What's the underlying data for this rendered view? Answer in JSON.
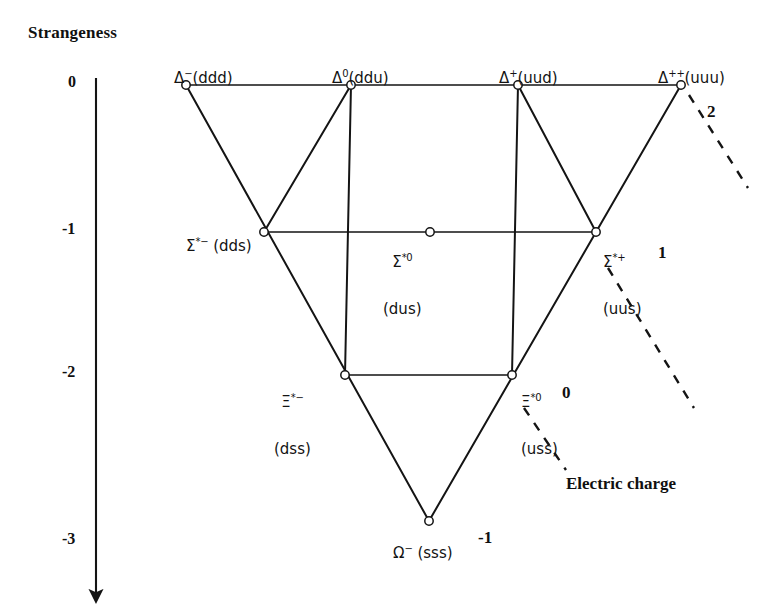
{
  "figure": {
    "kind": "baryon-decuplet-weight-diagram",
    "axis_title": "Strangeness",
    "charge_axis_title": "Electric charge",
    "line_color": "#141414",
    "vertex_fill": "#ffffff",
    "background": "#ffffff"
  },
  "strangeness_axis": {
    "ticks": [
      {
        "label": "0",
        "y_px": 85
      },
      {
        "label": "-1",
        "y_px": 232
      },
      {
        "label": "-2",
        "y_px": 375
      },
      {
        "label": "-3",
        "y_px": 542
      }
    ],
    "arrow_from_y": 78,
    "arrow_to_y": 604,
    "x_px": 96
  },
  "charge_labels": [
    {
      "label": "2",
      "x_px": 707,
      "y_px": 103
    },
    {
      "label": "1",
      "x_px": 658,
      "y_px": 244
    },
    {
      "label": "0",
      "x_px": 562,
      "y_px": 384
    },
    {
      "label": "-1",
      "x_px": 478,
      "y_px": 529
    }
  ],
  "nodes": [
    {
      "id": "delta-minus",
      "symbol": "Δ",
      "superscript": "−",
      "quarks": "(ddd)",
      "strangeness": 0,
      "charge": -1,
      "x_px": 186,
      "y_px": 85,
      "label_html": "Δ⁻(ddd)",
      "label_x_px": 155,
      "label_y_px": 55,
      "label_align": "left"
    },
    {
      "id": "delta-zero",
      "symbol": "Δ",
      "superscript": "0",
      "quarks": "(ddu)",
      "strangeness": 0,
      "charge": 0,
      "x_px": 351,
      "y_px": 85,
      "label_html": "Δ⁰(ddu)",
      "label_x_px": 313,
      "label_y_px": 55,
      "label_align": "left"
    },
    {
      "id": "delta-plus",
      "symbol": "Δ",
      "superscript": "+",
      "quarks": "(uud)",
      "strangeness": 0,
      "charge": 1,
      "x_px": 518,
      "y_px": 85,
      "label_html": "Δ⁺(uud)",
      "label_x_px": 480,
      "label_y_px": 55,
      "label_align": "left"
    },
    {
      "id": "delta-plusplus",
      "symbol": "Δ",
      "superscript": "++",
      "quarks": "(uuu)",
      "strangeness": 0,
      "charge": 2,
      "x_px": 681,
      "y_px": 85,
      "label_html": "Δ⁺⁺(uuu)",
      "label_x_px": 641,
      "label_y_px": 55,
      "label_align": "left"
    },
    {
      "id": "sigma-star-minus",
      "symbol": "Σ",
      "superscript": "*−",
      "quarks": "(dds)",
      "strangeness": -1,
      "charge": -1,
      "x_px": 264,
      "y_px": 232,
      "label_html": "Σ*⁻ (dds)",
      "label_x_px": 167,
      "label_y_px": 222,
      "label_align": "left"
    },
    {
      "id": "sigma-star-zero",
      "symbol": "Σ",
      "superscript": "*0",
      "quarks": "(dus)",
      "strangeness": -1,
      "charge": 0,
      "x_px": 430,
      "y_px": 232,
      "label_line1": "Σ*⁰",
      "label_line2": "(dus)",
      "label_x_px": 383,
      "label_y_px": 222,
      "label_align": "center"
    },
    {
      "id": "sigma-star-plus",
      "symbol": "Σ",
      "superscript": "*+",
      "quarks": "(uus)",
      "strangeness": -1,
      "charge": 1,
      "x_px": 596,
      "y_px": 232,
      "label_line1": "Σ*⁺",
      "label_line2": "(uus)",
      "label_x_px": 603,
      "label_y_px": 222,
      "label_align": "left"
    },
    {
      "id": "xi-star-minus",
      "symbol": "Ξ",
      "superscript": "*−",
      "quarks": "(dss)",
      "strangeness": -2,
      "charge": -1,
      "x_px": 345,
      "y_px": 375,
      "label_line1": "Ξ*⁻",
      "label_line2": "(dss)",
      "label_x_px": 276,
      "label_y_px": 362,
      "label_align": "center"
    },
    {
      "id": "xi-star-zero",
      "symbol": "Ξ",
      "superscript": "*0",
      "quarks": "(uss)",
      "strangeness": -2,
      "charge": 0,
      "x_px": 512,
      "y_px": 375,
      "label_line1": "Ξ*⁰",
      "label_line2": "(uss)",
      "label_x_px": 520,
      "label_y_px": 362,
      "label_align": "left"
    },
    {
      "id": "omega-minus",
      "symbol": "Ω",
      "superscript": "−",
      "quarks": "(sss)",
      "strangeness": -3,
      "charge": -1,
      "x_px": 429,
      "y_px": 521,
      "label_html": "Ω⁻ (sss)",
      "label_x_px": 374,
      "label_y_px": 530,
      "label_align": "left"
    }
  ],
  "solid_edges": [
    {
      "from": "delta-minus",
      "to": "delta-zero"
    },
    {
      "from": "delta-zero",
      "to": "delta-plus"
    },
    {
      "from": "delta-plus",
      "to": "delta-plusplus"
    },
    {
      "from": "sigma-star-minus",
      "to": "sigma-star-zero"
    },
    {
      "from": "sigma-star-zero",
      "to": "sigma-star-plus"
    },
    {
      "from": "xi-star-minus",
      "to": "xi-star-zero"
    },
    {
      "from": "delta-minus",
      "to": "omega-minus"
    },
    {
      "from": "delta-plusplus",
      "to": "omega-minus"
    },
    {
      "from": "delta-zero",
      "to": "xi-star-minus"
    },
    {
      "from": "delta-plus",
      "to": "xi-star-zero"
    },
    {
      "from": "sigma-star-plus",
      "to": "delta-plus"
    },
    {
      "from": "sigma-star-minus",
      "to": "delta-zero"
    }
  ],
  "dashed_charge_lines": [
    {
      "x1": 689,
      "y1": 95,
      "x2": 748,
      "y2": 188,
      "label": "2"
    },
    {
      "x1": 608,
      "y1": 268,
      "x2": 694,
      "y2": 408,
      "label": "1"
    },
    {
      "x1": 524,
      "y1": 408,
      "x2": 566,
      "y2": 470,
      "label": "0"
    }
  ]
}
